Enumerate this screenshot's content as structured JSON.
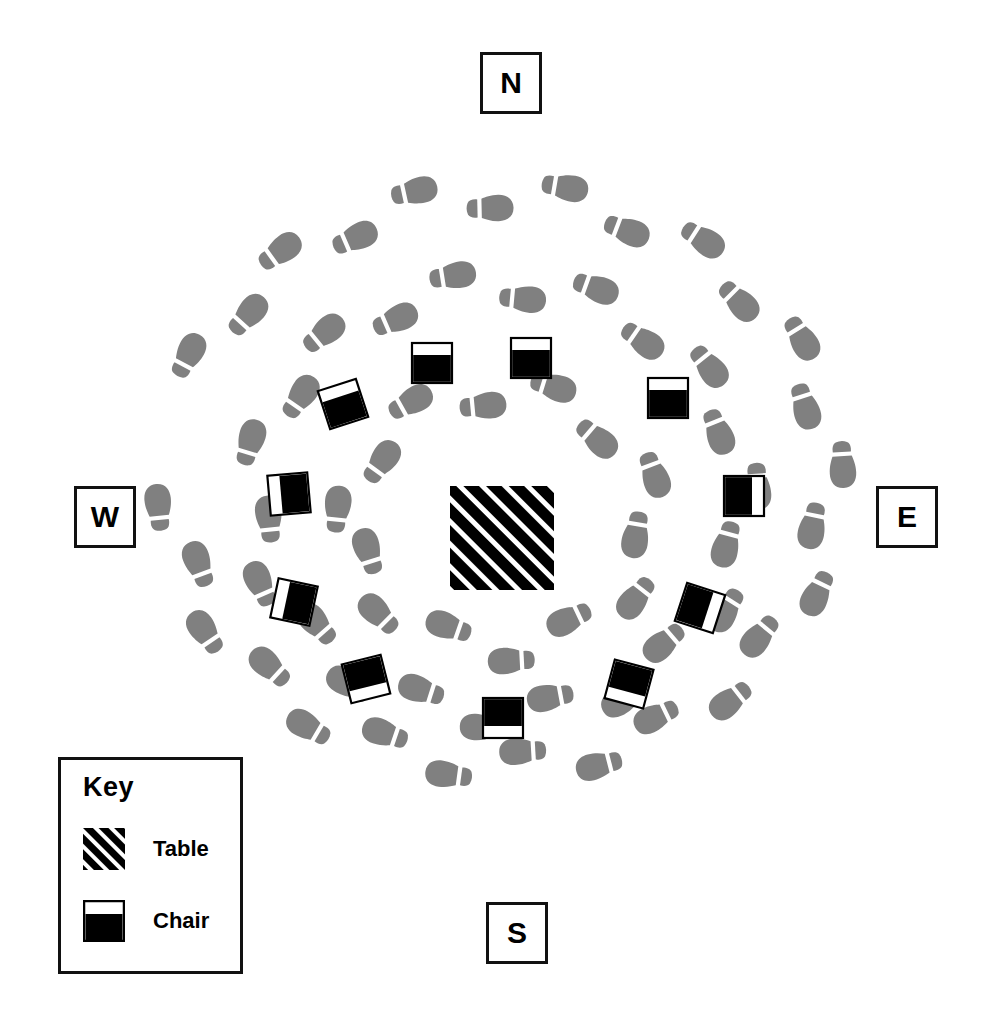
{
  "diagram": {
    "type": "floor-plan",
    "background_color": "#ffffff",
    "ink_color": "#000000",
    "footprint_color": "#808080"
  },
  "compass": {
    "north": "N",
    "west": "W",
    "east": "E",
    "south": "S"
  },
  "key": {
    "title": "Key",
    "items": [
      {
        "id": "table",
        "label": "Table",
        "swatch": "hatched-square",
        "color": "#000000"
      },
      {
        "id": "chair",
        "label": "Chair",
        "swatch": "half-black-square",
        "color": "#000000"
      }
    ]
  },
  "table": {
    "name": "Table",
    "shape": "square",
    "cx": 502,
    "cy": 538,
    "size": 104,
    "fill": "diagonal-hatch",
    "color": "#000000"
  },
  "chairs": [
    {
      "id": "chair-1",
      "cx": 432,
      "cy": 363,
      "rot": 0,
      "size": 40,
      "back": "top"
    },
    {
      "id": "chair-2",
      "cx": 531,
      "cy": 358,
      "rot": 0,
      "size": 40,
      "back": "top"
    },
    {
      "id": "chair-3",
      "cx": 343,
      "cy": 404,
      "rot": -18,
      "size": 40,
      "back": "top"
    },
    {
      "id": "chair-4",
      "cx": 289,
      "cy": 494,
      "rot": -5,
      "size": 40,
      "back": "left"
    },
    {
      "id": "chair-5",
      "cx": 294,
      "cy": 602,
      "rot": 12,
      "size": 40,
      "back": "left"
    },
    {
      "id": "chair-6",
      "cx": 366,
      "cy": 679,
      "rot": -14,
      "size": 40,
      "back": "bottom"
    },
    {
      "id": "chair-7",
      "cx": 503,
      "cy": 718,
      "rot": 0,
      "size": 40,
      "back": "bottom"
    },
    {
      "id": "chair-8",
      "cx": 629,
      "cy": 684,
      "rot": 15,
      "size": 40,
      "back": "bottom"
    },
    {
      "id": "chair-9",
      "cx": 700,
      "cy": 608,
      "rot": 18,
      "size": 40,
      "back": "right"
    },
    {
      "id": "chair-10",
      "cx": 744,
      "cy": 496,
      "rot": 0,
      "size": 40,
      "back": "right"
    },
    {
      "id": "chair-11",
      "cx": 668,
      "cy": 398,
      "rot": 0,
      "size": 0,
      "back": "top"
    }
  ],
  "footprint_tracks": [
    {
      "id": "outer-track",
      "description": "Outer oval footprint path, clockwise from northwest",
      "cx": 500,
      "cy": 480,
      "rx": 330,
      "ry": 285,
      "count": 27,
      "start_angle_deg": 205,
      "sweep_deg": 330
    },
    {
      "id": "middle-track",
      "description": "Middle oval footprint path",
      "cx": 500,
      "cy": 500,
      "rx": 245,
      "ry": 215,
      "count": 22,
      "start_angle_deg": 195,
      "sweep_deg": 340
    },
    {
      "id": "inner-track",
      "description": "Inner oval footprint path closest to the table",
      "cx": 500,
      "cy": 520,
      "rx": 150,
      "ry": 128,
      "count": 14,
      "start_angle_deg": 185,
      "sweep_deg": 340
    }
  ]
}
